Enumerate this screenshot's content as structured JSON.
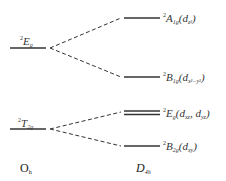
{
  "diagram": {
    "type": "energy-level-splitting",
    "left_group": {
      "label": "O",
      "label_sub": "h",
      "levels": [
        {
          "term_sup": "2",
          "term": "E",
          "term_sub": "g"
        },
        {
          "term_sup": "2",
          "term": "T",
          "term_sub": "2g"
        }
      ]
    },
    "right_group": {
      "label": "D",
      "label_sub": "4h",
      "levels": [
        {
          "term_sup": "2",
          "term": "A",
          "term_sub": "1g",
          "orbital": "(d",
          "orbital_sub": "z²",
          "orbital_close": ")"
        },
        {
          "term_sup": "2",
          "term": "B",
          "term_sub": "1g",
          "orbital": "(d",
          "orbital_sub": "x²−y²",
          "orbital_close": ")"
        },
        {
          "term_sup": "2",
          "term": "E",
          "term_sub": "g",
          "orbital": "(d",
          "orbital_sub": "xz",
          "orbital_mid": ", d",
          "orbital_sub2": "yz",
          "orbital_close": ")"
        },
        {
          "term_sup": "2",
          "term": "B",
          "term_sub": "2g",
          "orbital": "(d",
          "orbital_sub": "xy",
          "orbital_close": ")"
        }
      ]
    },
    "colors": {
      "line": "#333333",
      "text": "#222222"
    }
  }
}
